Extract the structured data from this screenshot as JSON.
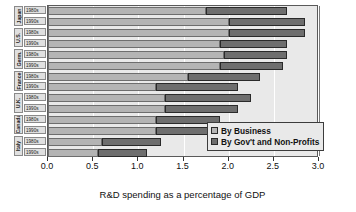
{
  "chart_data": {
    "type": "bar",
    "orientation": "horizontal",
    "stacked": true,
    "title": "",
    "xlabel": "R&D spending as a percentage of GDP",
    "ylabel": "",
    "xlim": [
      0.0,
      3.0
    ],
    "xticks": [
      "0.0",
      "0.5",
      "1.0",
      "1.5",
      "2.0",
      "2.5",
      "3.0"
    ],
    "xtick_values": [
      0.0,
      0.5,
      1.0,
      1.5,
      2.0,
      2.5,
      3.0
    ],
    "grid": true,
    "legend_position": "bottom-right",
    "legend": [
      "By Business",
      "By Gov't and Non-Profits"
    ],
    "series": [
      {
        "name": "By Business",
        "color": "#b4b4b4",
        "values": [
          1.75,
          2.0,
          2.0,
          1.9,
          1.95,
          1.9,
          1.55,
          1.2,
          1.3,
          1.3,
          1.2,
          1.2,
          0.6,
          0.55
        ]
      },
      {
        "name": "By Gov't and Non-Profits",
        "color": "#6e6e6e",
        "values": [
          0.9,
          0.85,
          0.85,
          0.75,
          0.7,
          0.7,
          0.8,
          0.9,
          0.95,
          0.8,
          0.7,
          0.65,
          0.65,
          0.55
        ]
      }
    ],
    "categories": [
      {
        "country": "Japan",
        "decade": "1980s",
        "business": 1.75,
        "government": 0.9,
        "total": 2.65
      },
      {
        "country": "Japan",
        "decade": "1990s",
        "business": 2.0,
        "government": 0.85,
        "total": 2.85
      },
      {
        "country": "U.S.",
        "decade": "1980s",
        "business": 2.0,
        "government": 0.85,
        "total": 2.85
      },
      {
        "country": "U.S.",
        "decade": "1990s",
        "business": 1.9,
        "government": 0.75,
        "total": 2.65
      },
      {
        "country": "Germ.",
        "decade": "1980s",
        "business": 1.95,
        "government": 0.7,
        "total": 2.65
      },
      {
        "country": "Germ.",
        "decade": "1990s",
        "business": 1.9,
        "government": 0.7,
        "total": 2.6
      },
      {
        "country": "France",
        "decade": "1980s",
        "business": 1.55,
        "government": 0.8,
        "total": 2.35
      },
      {
        "country": "France",
        "decade": "1990s",
        "business": 1.2,
        "government": 0.9,
        "total": 2.1
      },
      {
        "country": "U.K.",
        "decade": "1980s",
        "business": 1.3,
        "government": 0.95,
        "total": 2.25
      },
      {
        "country": "U.K.",
        "decade": "1990s",
        "business": 1.3,
        "government": 0.8,
        "total": 2.1
      },
      {
        "country": "Canada",
        "decade": "1980s",
        "business": 1.2,
        "government": 0.7,
        "total": 1.9
      },
      {
        "country": "Canada",
        "decade": "1990s",
        "business": 1.2,
        "government": 0.65,
        "total": 1.85
      },
      {
        "country": "Italy",
        "decade": "1980s",
        "business": 0.6,
        "government": 0.65,
        "total": 1.25
      },
      {
        "country": "Italy",
        "decade": "1990s",
        "business": 0.55,
        "government": 0.55,
        "total": 1.1
      }
    ],
    "country_groups": [
      {
        "label": "Japan",
        "rows": 2
      },
      {
        "label": "U.S.",
        "rows": 2
      },
      {
        "label": "Germ.",
        "rows": 2
      },
      {
        "label": "France",
        "rows": 2
      },
      {
        "label": "U.K.",
        "rows": 2
      },
      {
        "label": "Canada",
        "rows": 2
      },
      {
        "label": "Italy",
        "rows": 2
      }
    ]
  },
  "colors": {
    "business": "#b4b4b4",
    "government": "#6e6e6e",
    "plot_background": "#e9e9e9",
    "frame": "#5a5a5a",
    "gridline": "#ffffff",
    "text": "#111111"
  }
}
